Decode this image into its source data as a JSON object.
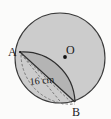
{
  "figure": {
    "background_color": "#fbfbfa",
    "labels": {
      "center": "O",
      "point_a": "A",
      "point_b": "B",
      "measurement": "16 cm"
    },
    "colors": {
      "circle_fill": "#cccccc",
      "segment_fill": "#b4b4b4",
      "outline": "#3a3a3a",
      "dashed": "#6e6e6e",
      "text": "#1a1a1a"
    },
    "geometry": {
      "circle": {
        "cx": 60,
        "cy": 58,
        "r": 45
      },
      "center_dot": {
        "cx": 65,
        "cy": 57,
        "r": 1.8
      },
      "point_a": {
        "x": 20,
        "y": 52
      },
      "point_b": {
        "x": 75,
        "y": 102
      },
      "radius_value": 16,
      "radius_unit": "cm"
    },
    "elements": [
      "outer-circle",
      "shaded-segment",
      "chord-ab",
      "arc-ab",
      "dashed-radius-a",
      "dashed-chord-ab",
      "dashed-arc-ab",
      "center-dot"
    ]
  }
}
